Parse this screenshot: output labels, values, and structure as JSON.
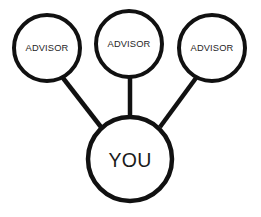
{
  "diagram": {
    "type": "node-link-diagram",
    "canvas": {
      "width": 261,
      "height": 217,
      "background": "#ffffff"
    },
    "stroke_color": "#111111",
    "text_color": "#252525",
    "nodes": [
      {
        "id": "advisor-left",
        "label": "ADVISOR",
        "cx": 47,
        "cy": 48,
        "r": 33,
        "stroke_width": 4,
        "font_size": 9.3
      },
      {
        "id": "advisor-center",
        "label": "ADVISOR",
        "cx": 129,
        "cy": 44,
        "r": 33,
        "stroke_width": 4,
        "font_size": 9.3
      },
      {
        "id": "advisor-right",
        "label": "ADVISOR",
        "cx": 212,
        "cy": 48,
        "r": 33,
        "stroke_width": 4,
        "font_size": 9.3
      },
      {
        "id": "you-center",
        "label": "YOU",
        "cx": 130,
        "cy": 159,
        "r": 42,
        "stroke_width": 4.5,
        "font_size": 19.5
      }
    ],
    "edges": [
      {
        "id": "edge-left",
        "from": "advisor-left",
        "to": "you-center",
        "x1": 63,
        "y1": 78,
        "x2": 101,
        "y2": 127,
        "stroke_width": 4.5
      },
      {
        "id": "edge-center",
        "from": "advisor-center",
        "to": "you-center",
        "x1": 130,
        "y1": 77,
        "x2": 130,
        "y2": 118,
        "stroke_width": 4.5
      },
      {
        "id": "edge-right",
        "from": "advisor-right",
        "to": "you-center",
        "x1": 196,
        "y1": 78,
        "x2": 160,
        "y2": 127,
        "stroke_width": 4.5
      }
    ]
  }
}
